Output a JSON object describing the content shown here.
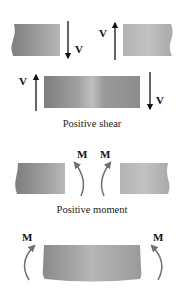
{
  "diagram": {
    "sections": [
      {
        "id": "shear",
        "caption": "Positive shear",
        "force_symbol": "V"
      },
      {
        "id": "moment",
        "caption": "Positive moment",
        "force_symbol": "M"
      }
    ],
    "labels": {
      "shear_top_left": "V",
      "shear_top_right": "V",
      "shear_mid_left": "V",
      "shear_mid_right": "V",
      "moment_top_left": "M",
      "moment_top_right": "M",
      "moment_bottom_left": "M",
      "moment_bottom_right": "M"
    },
    "colors": {
      "background": "#ffffff",
      "block_dark": "#8a8a8a",
      "block_light": "#c4c4c4",
      "arrow_shear": "#111111",
      "arrow_moment": "#6f6f6f",
      "text": "#111111"
    }
  }
}
